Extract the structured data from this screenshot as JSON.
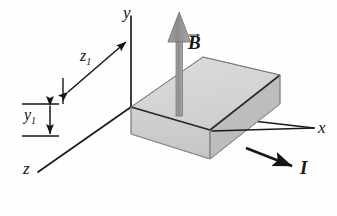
{
  "figure": {
    "background_color": "#fefefe"
  },
  "axes": {
    "x": {
      "label": "x",
      "direction": "right"
    },
    "y": {
      "label": "y",
      "direction": "up"
    },
    "z": {
      "label": "z",
      "direction": "lower-left"
    },
    "line_color": "#1a1a1d"
  },
  "vectors": {
    "magnetic_field": {
      "label": "B",
      "accent": "vector-arrow",
      "direction": "up",
      "color": "#8d8d8d",
      "outline_color": "#6f6f6f"
    },
    "current": {
      "label": "I",
      "accent": "plain",
      "direction": "right",
      "color": "#161619"
    }
  },
  "dimensions": [
    {
      "label": "z",
      "subscript": "1",
      "name": "depth",
      "orientation": "diagonal"
    },
    {
      "label": "y",
      "subscript": "1",
      "name": "thickness",
      "orientation": "vertical"
    }
  ],
  "slab": {
    "top_face_color": "#d6d6d6",
    "front_face_color": "#cdcdcd",
    "right_face_color": "#bcbcbc",
    "edge_color": "#2a2a2d"
  }
}
